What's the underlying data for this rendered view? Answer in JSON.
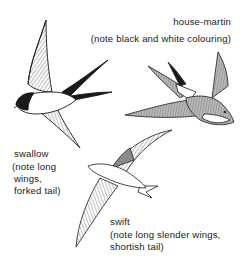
{
  "figure": {
    "birds": [
      {
        "id": "house-martin",
        "name": "house-martin",
        "note": "(note black and white colouring)"
      },
      {
        "id": "swallow",
        "name": "swallow",
        "note_lines": [
          "(note long",
          "wings,",
          "forked tail)"
        ]
      },
      {
        "id": "swift",
        "name": "swift",
        "note_lines": [
          "(note long slender wings,",
          "shortish tail)"
        ]
      }
    ],
    "colors": {
      "ink": "#1a1a1a",
      "background": "#ffffff",
      "martin_shade": "#9a9a9a"
    }
  }
}
